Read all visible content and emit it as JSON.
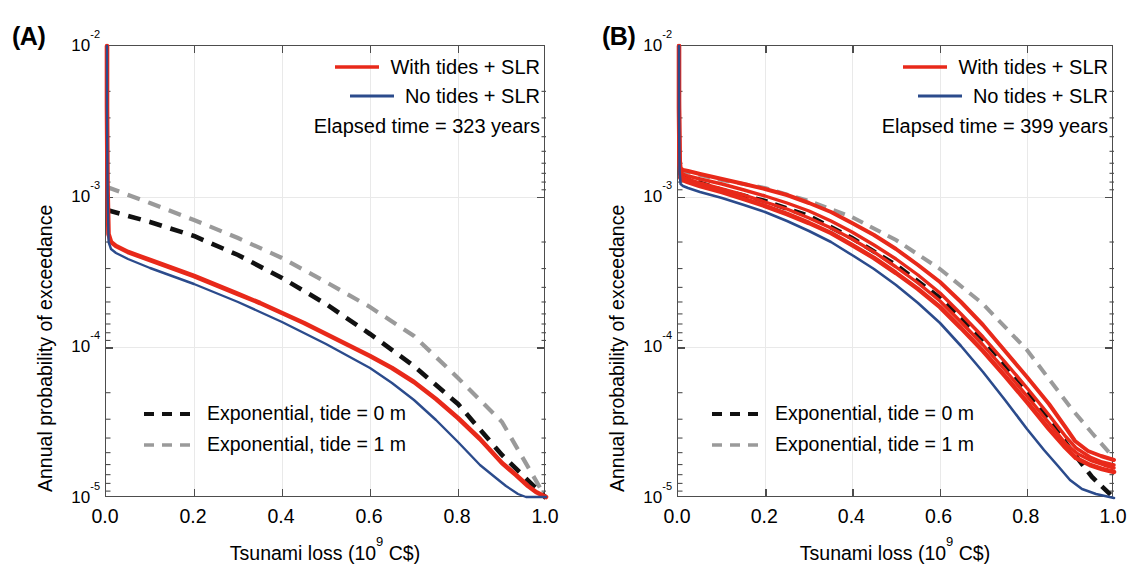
{
  "figure": {
    "panels": [
      {
        "letter": "(A)",
        "xlabel_prefix": "Tsunami loss (10",
        "xlabel_sup": "9",
        "xlabel_suffix": " C$)",
        "ylabel": "Annual probability of exceedance",
        "xticks": [
          "0.0",
          "0.2",
          "0.4",
          "0.6",
          "0.8",
          "1.0"
        ],
        "yticks": [
          "-2",
          "-3",
          "-4",
          "-5"
        ],
        "ytick_base": "10",
        "legend_top": [
          {
            "label": "With tides + SLR",
            "color": "#e8291a",
            "style": "solid"
          },
          {
            "label": "No tides + SLR",
            "color": "#2b4b8c",
            "style": "solid"
          }
        ],
        "note": "Elapsed time = 323 years",
        "legend_bottom": [
          {
            "label": "Exponential, tide = 0 m",
            "color": "#111111",
            "style": "dashed"
          },
          {
            "label": "Exponential, tide = 1 m",
            "color": "#9a9a9a",
            "style": "dashed"
          }
        ]
      },
      {
        "letter": "(B)",
        "xlabel_prefix": "Tsunami loss (10",
        "xlabel_sup": "9",
        "xlabel_suffix": " C$)",
        "ylabel": "Annual probability of exceedance",
        "xticks": [
          "0.0",
          "0.2",
          "0.4",
          "0.6",
          "0.8",
          "1.0"
        ],
        "yticks": [
          "-2",
          "-3",
          "-4",
          "-5"
        ],
        "ytick_base": "10",
        "legend_top": [
          {
            "label": "With tides + SLR",
            "color": "#e8291a",
            "style": "solid"
          },
          {
            "label": "No tides + SLR",
            "color": "#2b4b8c",
            "style": "solid"
          }
        ],
        "note": "Elapsed time = 399 years",
        "legend_bottom": [
          {
            "label": "Exponential, tide = 0 m",
            "color": "#111111",
            "style": "dashed"
          },
          {
            "label": "Exponential, tide = 1 m",
            "color": "#9a9a9a",
            "style": "dashed"
          }
        ]
      }
    ]
  },
  "chart_data": [
    {
      "type": "line",
      "title": "(A) Elapsed time = 323 years",
      "xlabel": "Tsunami loss (10^9 C$)",
      "ylabel": "Annual probability of exceedance",
      "xlim": [
        0.0,
        1.0
      ],
      "ylim": [
        1e-05,
        0.01
      ],
      "yscale": "log",
      "grid": true,
      "legend_position": "top-right / bottom-left",
      "series": [
        {
          "name": "With tides + SLR",
          "color": "#e8291a",
          "style": "solid",
          "x": [
            0.0,
            0.002,
            0.005,
            0.02,
            0.05,
            0.1,
            0.15,
            0.2,
            0.25,
            0.3,
            0.35,
            0.4,
            0.45,
            0.5,
            0.55,
            0.6,
            0.65,
            0.7,
            0.75,
            0.8,
            0.85,
            0.9,
            0.93,
            0.96,
            0.98,
            1.0
          ],
          "y": [
            0.01,
            0.003,
            0.00092,
            0.00086,
            0.0008,
            0.00072,
            0.00066,
            0.0006,
            0.00054,
            0.00048,
            0.00042,
            0.00036,
            0.00031,
            0.00026,
            0.00022,
            0.000185,
            0.00015,
            0.00012,
            9.2e-05,
            6.6e-05,
            4.4e-05,
            2.7e-05,
            2e-05,
            1.55e-05,
            1.3e-05,
            1.05e-05
          ]
        },
        {
          "name": "No tides + SLR",
          "color": "#2b4b8c",
          "style": "solid",
          "x": [
            0.0,
            0.002,
            0.005,
            0.02,
            0.05,
            0.1,
            0.15,
            0.2,
            0.25,
            0.3,
            0.35,
            0.4,
            0.45,
            0.5,
            0.55,
            0.6,
            0.65,
            0.7,
            0.75,
            0.8,
            0.85,
            0.9,
            0.93,
            0.96,
            0.98,
            1.0
          ],
          "y": [
            0.01,
            0.0026,
            0.00083,
            0.00076,
            0.0007,
            0.00062,
            0.00056,
            0.00051,
            0.00045,
            0.0004,
            0.00035,
            0.0003,
            0.00025,
            0.00021,
            0.000175,
            0.000145,
            0.000115,
            8.8e-05,
            6.6e-05,
            4.6e-05,
            2.9e-05,
            1.75e-05,
            1.35e-05,
            1.12e-05,
            1e-05,
            1e-05
          ]
        },
        {
          "name": "Exponential, tide = 0 m",
          "color": "#111111",
          "style": "dashed",
          "x": [
            0.0,
            0.1,
            0.2,
            0.3,
            0.4,
            0.5,
            0.6,
            0.7,
            0.8,
            0.9,
            1.0
          ],
          "y": [
            0.00138,
            0.00115,
            0.00096,
            0.00079,
            0.00064,
            0.0005,
            0.00038,
            0.000275,
            0.000185,
            0.000115,
            1.05e-05
          ]
        },
        {
          "name": "Exponential, tide = 1 m",
          "color": "#9a9a9a",
          "style": "dashed",
          "x": [
            0.0,
            0.1,
            0.2,
            0.3,
            0.4,
            0.5,
            0.6,
            0.7,
            0.8,
            0.9,
            1.0
          ],
          "y": [
            0.00162,
            0.00142,
            0.00122,
            0.00103,
            0.00086,
            0.0007,
            0.00055,
            0.00042,
            0.000305,
            0.000205,
            3.1e-05
          ]
        }
      ]
    },
    {
      "type": "line",
      "title": "(B) Elapsed time = 399 years",
      "xlabel": "Tsunami loss (10^9 C$)",
      "ylabel": "Annual probability of exceedance",
      "xlim": [
        0.0,
        1.0
      ],
      "ylim": [
        1e-05,
        0.01
      ],
      "yscale": "log",
      "grid": true,
      "legend_position": "top-right / bottom-left",
      "series": [
        {
          "name": "With tides + SLR",
          "color": "#e8291a",
          "style": "solid",
          "x": [
            0.0,
            0.002,
            0.005,
            0.02,
            0.05,
            0.1,
            0.15,
            0.2,
            0.25,
            0.3,
            0.35,
            0.4,
            0.45,
            0.5,
            0.55,
            0.6,
            0.65,
            0.7,
            0.75,
            0.8,
            0.85,
            0.9,
            0.93,
            0.96,
            0.98,
            1.0
          ],
          "y": [
            0.01,
            0.004,
            0.0017,
            0.00162,
            0.00155,
            0.00145,
            0.00135,
            0.00125,
            0.00112,
            0.001,
            0.00087,
            0.00074,
            0.00062,
            0.00051,
            0.00041,
            0.00032,
            0.000245,
            0.00018,
            0.000128,
            8.7e-05,
            5.6e-05,
            3.4e-05,
            2.7e-05,
            2.3e-05,
            2.1e-05,
            1.9e-05
          ]
        },
        {
          "name": "No tides + SLR",
          "color": "#2b4b8c",
          "style": "solid",
          "x": [
            0.0,
            0.002,
            0.005,
            0.02,
            0.05,
            0.1,
            0.15,
            0.2,
            0.25,
            0.3,
            0.35,
            0.4,
            0.45,
            0.5,
            0.55,
            0.6,
            0.65,
            0.7,
            0.75,
            0.8,
            0.85,
            0.9,
            0.93,
            0.96,
            0.98,
            1.0
          ],
          "y": [
            0.01,
            0.0034,
            0.00156,
            0.00148,
            0.0014,
            0.00128,
            0.00118,
            0.00108,
            0.00096,
            0.00085,
            0.00073,
            0.00061,
            0.0005,
            0.0004,
            0.000315,
            0.00024,
            0.000178,
            0.000128,
            8.8e-05,
            5.8e-05,
            3.6e-05,
            2.15e-05,
            1.6e-05,
            1.25e-05,
            1.1e-05,
            1e-05
          ]
        },
        {
          "name": "Exponential, tide = 0 m",
          "color": "#111111",
          "style": "dashed",
          "x": [
            0.0,
            0.1,
            0.2,
            0.3,
            0.4,
            0.5,
            0.6,
            0.7,
            0.8,
            0.9,
            0.95,
            1.0
          ],
          "y": [
            0.00155,
            0.00126,
            0.00106,
            0.00084,
            0.0006,
            0.000395,
            0.000238,
            0.000127,
            5.8e-05,
            2.3e-05,
            1.5e-05,
            1e-05
          ]
        },
        {
          "name": "Exponential, tide = 1 m",
          "color": "#9a9a9a",
          "style": "dashed",
          "x": [
            0.0,
            0.1,
            0.2,
            0.3,
            0.4,
            0.5,
            0.6,
            0.7,
            0.8,
            0.9,
            0.95,
            1.0
          ],
          "y": [
            0.0017,
            0.00147,
            0.00128,
            0.00105,
            0.0008,
            0.00056,
            0.00036,
            0.00021,
            0.000105,
            4.4e-05,
            3e-05,
            2e-05
          ]
        }
      ]
    }
  ]
}
